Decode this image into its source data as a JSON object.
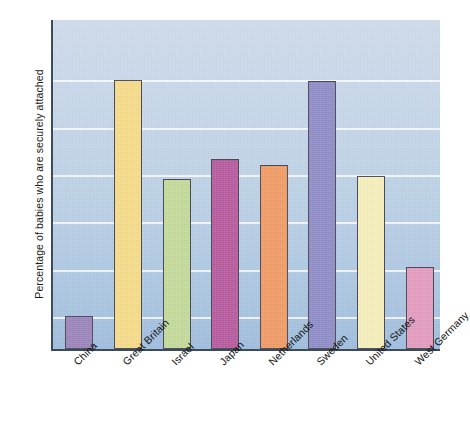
{
  "chart_data": {
    "type": "bar",
    "title": "",
    "xlabel": "",
    "ylabel": "Percentage of babies who are securely attached",
    "ylim": [
      46.5,
      81.5
    ],
    "yticks": [
      50,
      55,
      60,
      65,
      70,
      75
    ],
    "ytick_labels": [
      "50",
      "55",
      "60",
      "65",
      "70",
      "75"
    ],
    "grid": true,
    "legend": "none",
    "categories": [
      "China",
      "Great Britain",
      "Israel",
      "Japan",
      "Netherlands",
      "Sweden",
      "United States",
      "West Germany"
    ],
    "values": [
      50.0,
      74.9,
      64.5,
      66.6,
      66.0,
      74.8,
      64.8,
      55.2
    ],
    "bar_colors": [
      "#9c84bd",
      "#fadf89",
      "#c5dd9a",
      "#b9589f",
      "#f59b63",
      "#8f8cc9",
      "#fbf3bd",
      "#e89cc0"
    ],
    "bar_edge_color": "#4a4a55",
    "plot_background_top": "#cfdcec",
    "plot_background_bottom": "#a2bfdf",
    "gridline_color": "#ffffff",
    "axis_color": "#3b4a5c",
    "xtick_label_rotation_degrees": -45
  }
}
